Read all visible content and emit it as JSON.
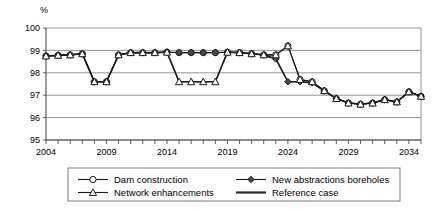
{
  "chart_data": {
    "type": "line",
    "title": "",
    "subtitle": "",
    "xlabel": "",
    "ylabel": "%",
    "ylim": [
      95,
      100
    ],
    "xlim": [
      2004,
      2035
    ],
    "yticks": [
      95,
      96,
      97,
      98,
      99,
      100
    ],
    "ytick_labels": [
      "95",
      "96",
      "97",
      "98",
      "99",
      "100"
    ],
    "xticks": [
      2004,
      2009,
      2014,
      2019,
      2024,
      2029,
      2034
    ],
    "xtick_labels": [
      "2004",
      "2009",
      "2014",
      "2019",
      "2024",
      "2029",
      "2034"
    ],
    "grid": true,
    "legend_position": "bottom",
    "x": [
      2004,
      2005,
      2006,
      2007,
      2008,
      2009,
      2010,
      2011,
      2012,
      2013,
      2014,
      2015,
      2016,
      2017,
      2018,
      2019,
      2020,
      2021,
      2022,
      2023,
      2024,
      2025,
      2026,
      2027,
      2028,
      2029,
      2030,
      2031,
      2032,
      2033,
      2034,
      2035
    ],
    "series": [
      {
        "name": "Dam construction",
        "marker": "open-circle",
        "values": [
          98.75,
          98.78,
          98.8,
          98.85,
          97.6,
          97.6,
          98.8,
          98.9,
          98.9,
          98.9,
          98.92,
          98.9,
          98.9,
          98.9,
          98.9,
          98.92,
          98.9,
          98.85,
          98.8,
          98.8,
          99.2,
          97.7,
          97.6,
          97.2,
          96.85,
          96.65,
          96.6,
          96.65,
          96.8,
          96.7,
          97.15,
          96.95
        ]
      },
      {
        "name": "New abstractions boreholes",
        "marker": "filled-diamond",
        "values": [
          98.75,
          98.78,
          98.8,
          98.85,
          97.6,
          97.6,
          98.8,
          98.9,
          98.9,
          98.9,
          98.92,
          98.9,
          98.9,
          98.9,
          98.9,
          98.92,
          98.9,
          98.85,
          98.8,
          98.62,
          97.6,
          97.6,
          97.55,
          97.2,
          96.85,
          96.65,
          96.6,
          96.65,
          96.8,
          96.7,
          97.15,
          96.95
        ]
      },
      {
        "name": "Network enhancements",
        "marker": "open-triangle",
        "values": [
          98.75,
          98.78,
          98.8,
          98.85,
          97.6,
          97.6,
          98.8,
          98.9,
          98.9,
          98.9,
          98.92,
          97.6,
          97.6,
          97.6,
          97.6,
          98.92,
          98.9,
          98.85,
          98.8,
          98.8,
          99.2,
          97.7,
          97.6,
          97.2,
          96.85,
          96.65,
          96.6,
          96.65,
          96.8,
          96.7,
          97.15,
          96.95
        ]
      },
      {
        "name": "Reference case",
        "marker": "none",
        "values": [
          98.75,
          98.78,
          98.8,
          98.85,
          97.6,
          97.6,
          98.8,
          98.9,
          98.9,
          98.9,
          98.92,
          97.6,
          97.6,
          97.6,
          97.6,
          98.92,
          98.9,
          98.85,
          98.8,
          98.62,
          97.6,
          97.6,
          97.55,
          97.2,
          96.85,
          96.65,
          96.6,
          96.65,
          96.8,
          96.7,
          97.15,
          96.95
        ]
      }
    ],
    "legend": [
      {
        "label": "Dam construction",
        "marker": "open-circle"
      },
      {
        "label": "New abstractions boreholes",
        "marker": "filled-diamond"
      },
      {
        "label": "Network enhancements",
        "marker": "open-triangle"
      },
      {
        "label": "Reference case",
        "marker": "none"
      }
    ],
    "colors": {
      "line": "#1a1a1a",
      "grid": "#8a8a8a",
      "marker_fill": "#4a4a4a",
      "background": "#ffffff"
    }
  }
}
